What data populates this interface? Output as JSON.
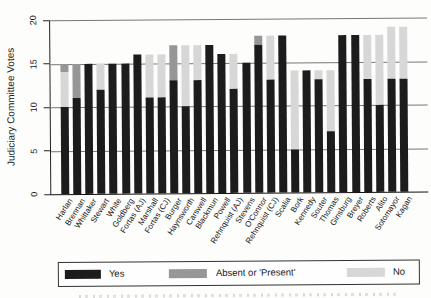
{
  "y_axis": {
    "label": "Judiciary Committee Votes",
    "ticks": [
      "20",
      "15",
      "10",
      "5",
      "0"
    ]
  },
  "legend": {
    "position": "bottom",
    "items": [
      {
        "label": "Yes",
        "color": "#1c1c1c"
      },
      {
        "label": "Absent or 'Present'",
        "color": "#969696"
      },
      {
        "label": "No",
        "color": "#d7d7d7"
      }
    ]
  },
  "chart_data": {
    "type": "bar",
    "stacked": true,
    "grid": "horizontal",
    "ylim": [
      0,
      20
    ],
    "ylabel": "Judiciary Committee Votes",
    "xlabel": "",
    "title": "",
    "categories": [
      "Harlan",
      "Brennan",
      "Whittaker",
      "Stewart",
      "White",
      "Goldberg",
      "Fortas (AJ)",
      "Marshall",
      "Fortas (CJ)",
      "Burger",
      "Haynsworth",
      "Carswell",
      "Blackmun",
      "Powell",
      "Rehnquist (AJ)",
      "Stevens",
      "O'Connor",
      "Rehnquist (CJ)",
      "Scalia",
      "Bork",
      "Kennedy",
      "Souter",
      "Thomas",
      "Ginsburg",
      "Breyer",
      "Roberts",
      "Alito",
      "Sotomayor",
      "Kagan"
    ],
    "stack_order_bottom_to_top": [
      "Yes",
      "No",
      "Absent or 'Present'"
    ],
    "series": [
      {
        "name": "Yes",
        "color": "#1c1c1c",
        "values": [
          10,
          11,
          15,
          12,
          15,
          15,
          16,
          11,
          11,
          13,
          10,
          13,
          17,
          16,
          12,
          15,
          17,
          13,
          18,
          5,
          14,
          13,
          7,
          18,
          18,
          13,
          10,
          13,
          13
        ]
      },
      {
        "name": "No",
        "color": "#d7d7d7",
        "values": [
          4,
          0,
          0,
          3,
          0,
          0,
          0,
          5,
          5,
          0,
          7,
          4,
          0,
          0,
          4,
          0,
          0,
          5,
          0,
          9,
          0,
          1,
          7,
          0,
          0,
          5,
          8,
          6,
          6
        ]
      },
      {
        "name": "Absent or 'Present'",
        "color": "#969696",
        "values": [
          1,
          4,
          0,
          0,
          0,
          0,
          0,
          0,
          0,
          4,
          0,
          0,
          0,
          0,
          0,
          0,
          1,
          0,
          0,
          0,
          0,
          0,
          0,
          0,
          0,
          0,
          0,
          0,
          0
        ]
      }
    ]
  }
}
